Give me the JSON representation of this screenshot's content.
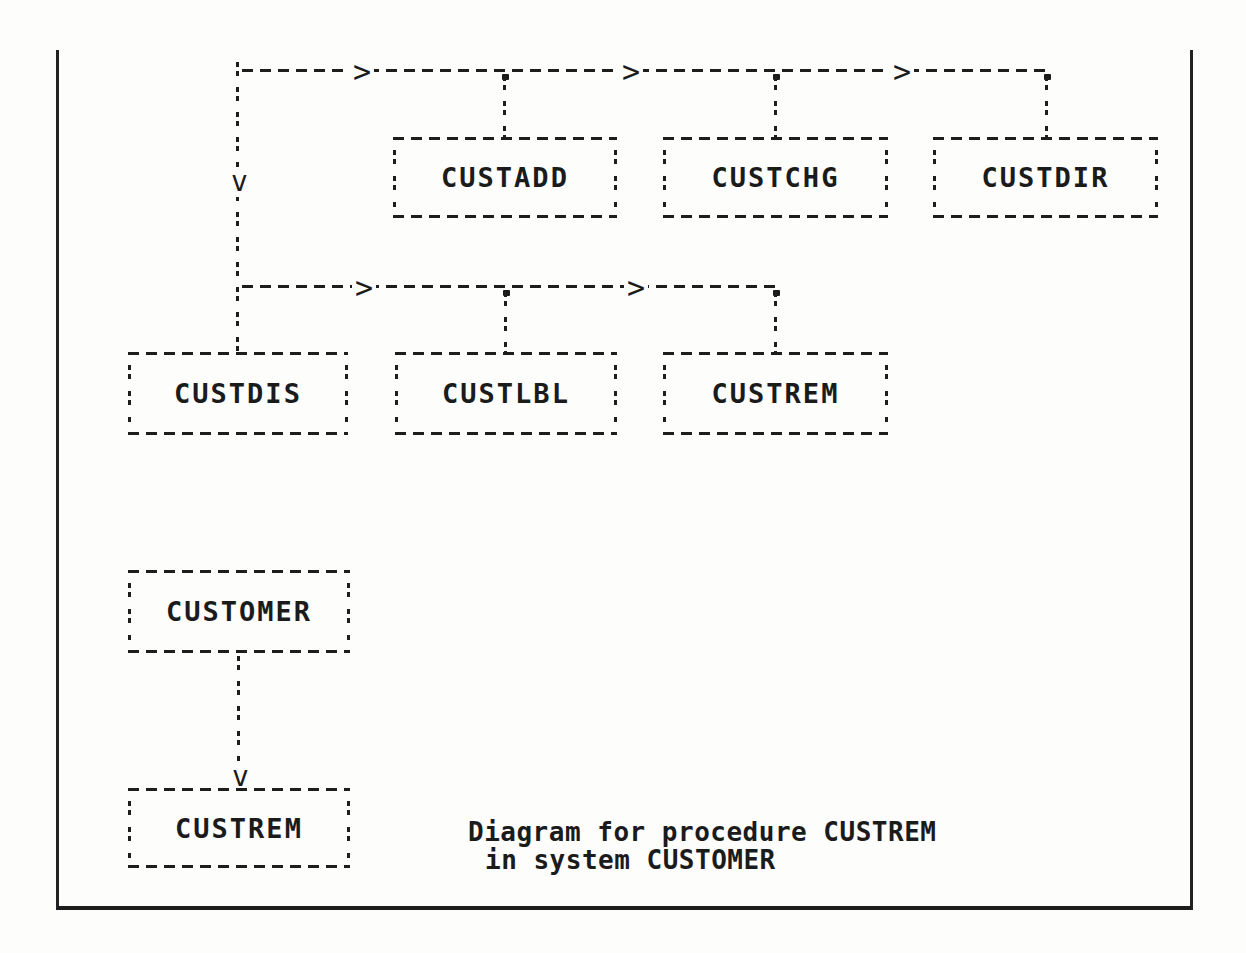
{
  "page": {
    "paper_color": "#fdfdfb",
    "ink_color": "#1b1b1b"
  },
  "diagram": {
    "nodes": [
      {
        "id": "custadd",
        "label": "CUSTADD"
      },
      {
        "id": "custchg",
        "label": "CUSTCHG"
      },
      {
        "id": "custdir",
        "label": "CUSTDIR"
      },
      {
        "id": "custdis",
        "label": "CUSTDIS"
      },
      {
        "id": "custlbl",
        "label": "CUSTLBL"
      },
      {
        "id": "custrem-called",
        "label": "CUSTREM"
      },
      {
        "id": "customer",
        "label": "CUSTOMER"
      },
      {
        "id": "custrem-procedure",
        "label": "CUSTREM"
      }
    ],
    "glyphs": {
      "arrow_right": ">",
      "arrow_down": "v"
    },
    "caption": {
      "line1": "Diagram for procedure CUSTREM",
      "line2": "in system CUSTOMER"
    }
  }
}
